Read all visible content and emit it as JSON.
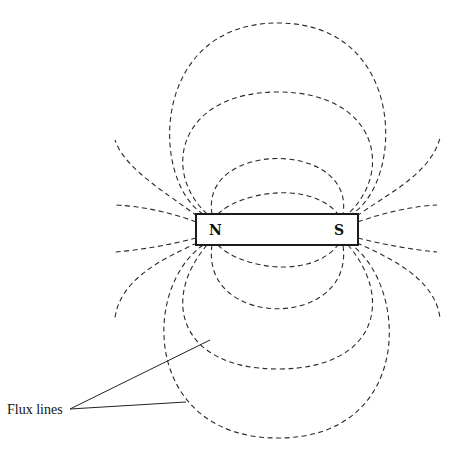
{
  "diagram": {
    "magnet": {
      "north_label": "N",
      "south_label": "S"
    },
    "annotation": {
      "label": "Flux lines"
    },
    "colors": {
      "line": "#2a2a2a",
      "background": "#ffffff"
    }
  }
}
